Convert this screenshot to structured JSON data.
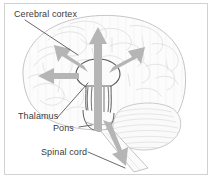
{
  "figure": {
    "type": "anatomical-diagram",
    "background_color": "#ffffff",
    "frame_color": "#d2d2d2",
    "outline_color": "#b9b9b9",
    "fill_color": "#fbfbfb",
    "arrow_color": "#b4b4b4",
    "leader_color": "#585858",
    "text_color": "#3b3b3b"
  },
  "labels": [
    {
      "id": "cerebral-cortex",
      "text": "Cerebral cortex"
    },
    {
      "id": "thalamus",
      "text": "Thalamus"
    },
    {
      "id": "pons",
      "text": "Pons"
    },
    {
      "id": "spinal-cord",
      "text": "Spinal cord"
    }
  ],
  "structures": {
    "cerebral_cortex": "cerebral-cortex-outline",
    "cerebellum": "cerebellum-outline",
    "thalamus": "thalamus-oval",
    "pons": "pons-striations",
    "spinal_cord": "spinal-cord-shaft"
  },
  "arrows": [
    {
      "id": "arrow-up",
      "direction": "up",
      "target": "cerebral cortex"
    },
    {
      "id": "arrow-upper-left",
      "direction": "upper-left",
      "target": "cerebral cortex"
    },
    {
      "id": "arrow-upper-right",
      "direction": "upper-right",
      "target": "cerebral cortex"
    },
    {
      "id": "arrow-left",
      "direction": "left",
      "target": "cerebral cortex"
    },
    {
      "id": "arrow-down",
      "direction": "lower-right",
      "target": "spinal cord"
    }
  ]
}
